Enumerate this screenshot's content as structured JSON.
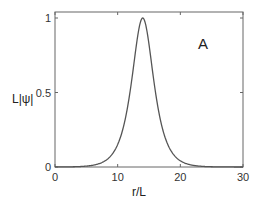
{
  "chart_data": {
    "type": "line",
    "title": "",
    "panel_label": "A",
    "xlabel": "r/L",
    "ylabel": "L|ψ|",
    "xlim": [
      0,
      30
    ],
    "ylim": [
      0,
      1.05
    ],
    "xticks": [
      0,
      10,
      20,
      30
    ],
    "xtick_labels": [
      "0",
      "10",
      "20",
      "30"
    ],
    "yticks": [
      0,
      0.5,
      1
    ],
    "ytick_labels": [
      "0",
      "0.5",
      "1"
    ],
    "grid": false,
    "legend": null,
    "series": [
      {
        "name": "L|ψ|",
        "color": "#555555",
        "x": [
          0,
          2,
          4,
          6,
          7,
          8,
          9,
          10,
          11,
          12,
          12.5,
          13,
          13.5,
          14,
          14.5,
          15,
          15.5,
          16,
          17,
          18,
          19,
          20,
          21,
          22,
          24,
          26,
          28,
          30
        ],
        "y": [
          0.0,
          0.0,
          0.0,
          0.005,
          0.012,
          0.03,
          0.07,
          0.15,
          0.3,
          0.55,
          0.7,
          0.85,
          0.96,
          1.0,
          0.96,
          0.85,
          0.7,
          0.55,
          0.3,
          0.15,
          0.07,
          0.03,
          0.012,
          0.005,
          0.001,
          0.0,
          0.0,
          0.0
        ]
      }
    ]
  }
}
